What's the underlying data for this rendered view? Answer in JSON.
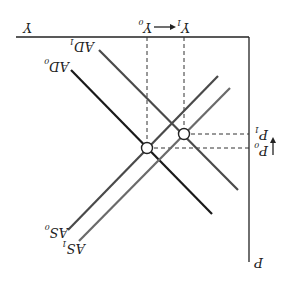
{
  "diagram": {
    "orientation": "rotated-180",
    "axes": {
      "x_label": "Y",
      "y_label": "P"
    },
    "output_labels": {
      "y0": {
        "base": "Y",
        "sub": "0"
      },
      "y1": {
        "base": "Y",
        "sub": "1"
      }
    },
    "price_labels": {
      "p0": {
        "base": "P",
        "sub": "0"
      },
      "p1": {
        "base": "P",
        "sub": "1"
      }
    },
    "curves": [
      {
        "id": "AD0",
        "base": "AD",
        "sub": "0",
        "color": "#1a1a1a"
      },
      {
        "id": "AD1",
        "base": "AD",
        "sub": "1",
        "color": "#4a4a4a"
      },
      {
        "id": "AS0",
        "base": "AS",
        "sub": "0",
        "color": "#4a4a4a"
      },
      {
        "id": "AS1",
        "base": "AS",
        "sub": "1",
        "color": "#6a6a6a"
      }
    ],
    "equilibria": [
      {
        "id": "E0",
        "description": "AD0 ∩ AS0 at (Y0, P0)"
      },
      {
        "id": "E1",
        "description": "AD1 ∩ AS1 at (Y1, P1)"
      }
    ],
    "arrows": [
      {
        "id": "output-shift",
        "from": "Y0",
        "to": "Y1"
      },
      {
        "id": "price-shift",
        "from": "P0",
        "to": "P1"
      }
    ]
  }
}
